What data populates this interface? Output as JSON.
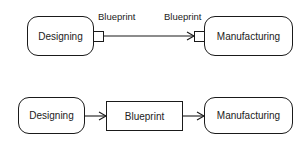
{
  "colors": {
    "stroke": "#1a1a1a",
    "text": "#222222",
    "background": "#ffffff"
  },
  "diagram_top": {
    "nodes": [
      {
        "id": "designing",
        "label": "Designing",
        "shape": "rounded-rect"
      },
      {
        "id": "manufacturing",
        "label": "Manufacturing",
        "shape": "rounded-rect"
      }
    ],
    "ports": [
      {
        "owner": "designing",
        "side": "right",
        "label": "Blueprint",
        "role": "output-pin"
      },
      {
        "owner": "manufacturing",
        "side": "left",
        "label": "Blueprint",
        "role": "input-pin"
      }
    ],
    "edges": [
      {
        "from": "designing.output-pin",
        "to": "manufacturing.input-pin",
        "arrow": "open-arrowhead"
      }
    ]
  },
  "diagram_bottom": {
    "nodes": [
      {
        "id": "designing",
        "label": "Designing",
        "shape": "rounded-rect"
      },
      {
        "id": "blueprint",
        "label": "Blueprint",
        "shape": "rect"
      },
      {
        "id": "manufacturing",
        "label": "Manufacturing",
        "shape": "rounded-rect"
      }
    ],
    "edges": [
      {
        "from": "designing",
        "to": "blueprint",
        "arrow": "open-arrowhead"
      },
      {
        "from": "blueprint",
        "to": "manufacturing",
        "arrow": "open-arrowhead"
      }
    ]
  }
}
